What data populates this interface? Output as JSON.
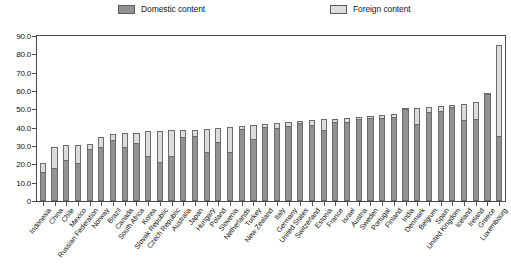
{
  "legend": {
    "position": "top",
    "entries": [
      {
        "label": "Domestic content",
        "color": "#929292",
        "key": "domestic"
      },
      {
        "label": "Foreign content",
        "color": "#dcdcdc",
        "key": "foreign"
      }
    ]
  },
  "axes": {
    "y_tick_labels": [
      "90.0",
      "80.0",
      "70.0",
      "60.0",
      "50.0",
      "40.0",
      "30.0",
      "20.0",
      "10.0",
      "0"
    ],
    "y_min": 0,
    "y_max": 90,
    "y_step": 10,
    "grid": false
  },
  "chart_data": {
    "type": "bar",
    "stacked": true,
    "title": "",
    "subtitle": "",
    "xlabel": "",
    "ylabel": "",
    "ylim": [
      0,
      90
    ],
    "ytick_step": 10,
    "legend_position": "top",
    "grid": false,
    "categories": [
      "Indonesia",
      "China",
      "Chile",
      "Mexico",
      "Russian Federation",
      "Norway",
      "Brazil",
      "Canada",
      "South Africa",
      "Korea",
      "Slovak Republic",
      "Czech Republic",
      "Australia",
      "Japan",
      "Hungary",
      "Poland",
      "Slovenia",
      "Netherlands",
      "Turkey",
      "New Zealand",
      "Italy",
      "Germany",
      "United States",
      "Switzerland",
      "Estonia",
      "France",
      "Israel",
      "Austria",
      "Sweden",
      "Portugal",
      "Finland",
      "India",
      "Denmark",
      "Belgium",
      "Spain",
      "United Kingdom",
      "Iceland",
      "Ireland",
      "Greece",
      "Luxembourg"
    ],
    "series": [
      {
        "name": "Domestic content",
        "color": "#929292",
        "values": [
          16.0,
          18.0,
          22.5,
          21.0,
          28.5,
          29.5,
          33.5,
          29.5,
          31.5,
          24.5,
          21.5,
          24.5,
          35.0,
          35.5,
          27.0,
          32.0,
          27.0,
          39.5,
          34.0,
          40.5,
          40.0,
          41.0,
          42.5,
          41.5,
          39.0,
          43.0,
          43.0,
          44.5,
          45.5,
          45.5,
          46.0,
          50.0,
          42.0,
          48.5,
          49.0,
          51.5,
          44.0,
          45.0,
          58.5,
          35.5
        ]
      },
      {
        "name": "Foreign content",
        "color": "#dcdcdc",
        "values": [
          5.0,
          11.5,
          8.0,
          9.5,
          2.5,
          5.5,
          3.0,
          7.5,
          5.5,
          13.5,
          16.5,
          14.0,
          3.5,
          3.0,
          12.5,
          8.0,
          13.5,
          1.5,
          7.5,
          1.5,
          2.5,
          2.0,
          1.0,
          2.5,
          5.5,
          2.0,
          2.5,
          1.5,
          1.0,
          1.5,
          1.5,
          0.5,
          9.0,
          3.0,
          3.0,
          1.0,
          9.0,
          9.0,
          0.5,
          49.5
        ]
      }
    ],
    "totals": [
      21.0,
      29.5,
      30.5,
      30.5,
      31.0,
      35.0,
      36.5,
      37.0,
      37.0,
      38.0,
      38.0,
      38.5,
      38.5,
      38.5,
      39.5,
      40.0,
      40.5,
      41.0,
      41.5,
      42.0,
      42.5,
      43.0,
      43.5,
      44.0,
      44.5,
      45.0,
      45.5,
      46.0,
      46.5,
      47.0,
      47.5,
      50.5,
      51.0,
      51.5,
      52.0,
      52.5,
      53.0,
      54.0,
      59.0,
      85.0
    ]
  }
}
